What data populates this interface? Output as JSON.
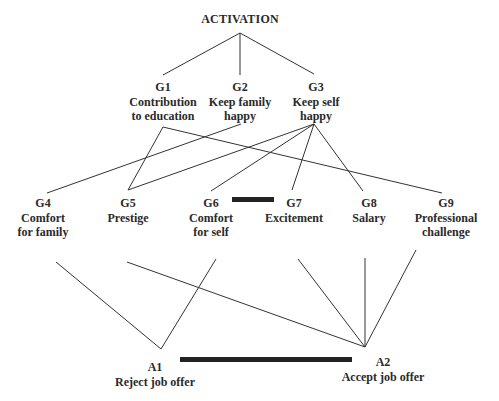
{
  "diagram": {
    "root": {
      "id": "activation",
      "label": "ACTIVATION"
    },
    "goals_level1": [
      {
        "id": "G1",
        "code": "G1",
        "lines": [
          "Contribution",
          "to education"
        ]
      },
      {
        "id": "G2",
        "code": "G2",
        "lines": [
          "Keep family",
          "happy"
        ]
      },
      {
        "id": "G3",
        "code": "G3",
        "lines": [
          "Keep self",
          "happy"
        ]
      }
    ],
    "goals_level2": [
      {
        "id": "G4",
        "code": "G4",
        "lines": [
          "Comfort",
          "for family"
        ]
      },
      {
        "id": "G5",
        "code": "G5",
        "lines": [
          "Prestige"
        ]
      },
      {
        "id": "G6",
        "code": "G6",
        "lines": [
          "Comfort",
          "for self"
        ]
      },
      {
        "id": "G7",
        "code": "G7",
        "lines": [
          "Excitement"
        ]
      },
      {
        "id": "G8",
        "code": "G8",
        "lines": [
          "Salary"
        ]
      },
      {
        "id": "G9",
        "code": "G9",
        "lines": [
          "Professional",
          "challenge"
        ]
      }
    ],
    "alternatives": [
      {
        "id": "A1",
        "code": "A1",
        "lines": [
          "Reject job offer"
        ]
      },
      {
        "id": "A2",
        "code": "A2",
        "lines": [
          "Accept job offer"
        ]
      }
    ],
    "edges": [
      [
        "activation",
        "G1"
      ],
      [
        "activation",
        "G2"
      ],
      [
        "activation",
        "G3"
      ],
      [
        "G1",
        "G5"
      ],
      [
        "G1",
        "G9"
      ],
      [
        "G2",
        "G4"
      ],
      [
        "G3",
        "G5"
      ],
      [
        "G3",
        "G6"
      ],
      [
        "G3",
        "G7"
      ],
      [
        "G3",
        "G8"
      ],
      [
        "G4",
        "A1"
      ],
      [
        "G6",
        "A1"
      ],
      [
        "G5",
        "A2"
      ],
      [
        "G7",
        "A2"
      ],
      [
        "G8",
        "A2"
      ],
      [
        "G9",
        "A2"
      ]
    ],
    "inhibitory_links": [
      [
        "G6",
        "G7"
      ],
      [
        "A1",
        "A2"
      ]
    ]
  }
}
